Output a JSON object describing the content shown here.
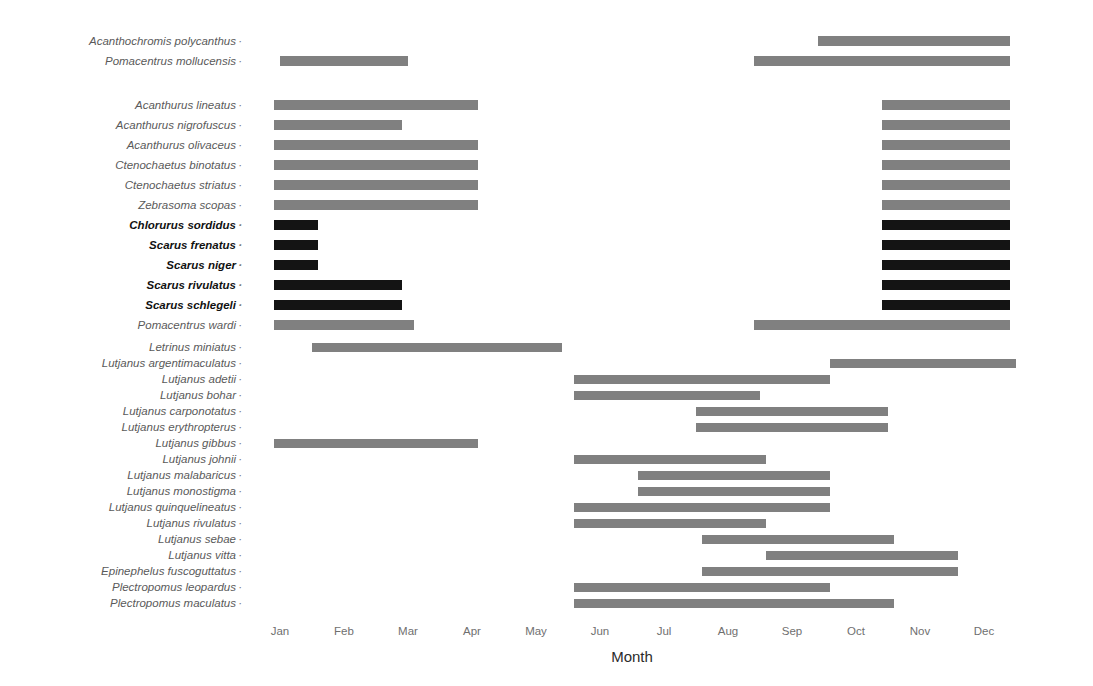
{
  "chart_data": {
    "type": "bar",
    "title": "",
    "xlabel": "Month",
    "ylabel": "",
    "grid": false,
    "legend": "none",
    "xlim": [
      0.5,
      12.5
    ],
    "x_tick_labels": [
      "Jan",
      "Feb",
      "Mar",
      "Apr",
      "May",
      "Jun",
      "Jul",
      "Aug",
      "Sep",
      "Oct",
      "Nov",
      "Dec"
    ],
    "x_tick_values": [
      1,
      2,
      3,
      4,
      5,
      6,
      7,
      8,
      9,
      10,
      11,
      12
    ],
    "colors": {
      "gray_bar": "#808080",
      "black_bar": "#141414",
      "label_gray": "#5a5a5a",
      "label_black": "#111111",
      "background": "#ffffff"
    },
    "groups": [
      {
        "name": "group-1",
        "rows": [
          {
            "label": "Acanthochromis polycanthus",
            "bold": false,
            "color": "#808080",
            "segments": [
              [
                9.4,
                12.4
              ]
            ]
          },
          {
            "label": "Pomacentrus mollucensis",
            "bold": false,
            "color": "#808080",
            "segments": [
              [
                1.0,
                3.0
              ],
              [
                8.4,
                12.4
              ]
            ]
          }
        ]
      },
      {
        "name": "group-2",
        "rows": [
          {
            "label": "Acanthurus lineatus",
            "bold": false,
            "color": "#808080",
            "segments": [
              [
                0.9,
                4.1
              ],
              [
                10.4,
                12.4
              ]
            ]
          },
          {
            "label": "Acanthurus nigrofuscus",
            "bold": false,
            "color": "#808080",
            "segments": [
              [
                0.9,
                2.9
              ],
              [
                10.4,
                12.4
              ]
            ]
          },
          {
            "label": "Acanthurus olivaceus",
            "bold": false,
            "color": "#808080",
            "segments": [
              [
                0.9,
                4.1
              ],
              [
                10.4,
                12.4
              ]
            ]
          },
          {
            "label": "Ctenochaetus binotatus",
            "bold": false,
            "color": "#808080",
            "segments": [
              [
                0.9,
                4.1
              ],
              [
                10.4,
                12.4
              ]
            ]
          },
          {
            "label": "Ctenochaetus striatus",
            "bold": false,
            "color": "#808080",
            "segments": [
              [
                0.9,
                4.1
              ],
              [
                10.4,
                12.4
              ]
            ]
          },
          {
            "label": "Zebrasoma scopas",
            "bold": false,
            "color": "#808080",
            "segments": [
              [
                0.9,
                4.1
              ],
              [
                10.4,
                12.4
              ]
            ]
          },
          {
            "label": "Chlorurus sordidus",
            "bold": true,
            "color": "#141414",
            "segments": [
              [
                0.9,
                1.6
              ],
              [
                10.4,
                12.4
              ]
            ]
          },
          {
            "label": "Scarus frenatus",
            "bold": true,
            "color": "#141414",
            "segments": [
              [
                0.9,
                1.6
              ],
              [
                10.4,
                12.4
              ]
            ]
          },
          {
            "label": "Scarus niger",
            "bold": true,
            "color": "#141414",
            "segments": [
              [
                0.9,
                1.6
              ],
              [
                10.4,
                12.4
              ]
            ]
          },
          {
            "label": "Scarus rivulatus",
            "bold": true,
            "color": "#141414",
            "segments": [
              [
                0.9,
                2.9
              ],
              [
                10.4,
                12.4
              ]
            ]
          },
          {
            "label": "Scarus schlegeli",
            "bold": true,
            "color": "#141414",
            "segments": [
              [
                0.9,
                2.9
              ],
              [
                10.4,
                12.4
              ]
            ]
          },
          {
            "label": "Pomacentrus wardi",
            "bold": false,
            "color": "#808080",
            "segments": [
              [
                0.9,
                3.1
              ],
              [
                8.4,
                12.4
              ]
            ]
          }
        ]
      },
      {
        "name": "group-3",
        "rows": [
          {
            "label": "Letrinus miniatus",
            "bold": false,
            "color": "#808080",
            "segments": [
              [
                1.5,
                5.4
              ]
            ]
          },
          {
            "label": "Lutjanus argentimaculatus",
            "bold": false,
            "color": "#808080",
            "segments": [
              [
                9.6,
                12.5
              ]
            ]
          },
          {
            "label": "Lutjanus adetii",
            "bold": false,
            "color": "#808080",
            "segments": [
              [
                5.6,
                9.6
              ]
            ]
          },
          {
            "label": "Lutjanus bohar",
            "bold": false,
            "color": "#808080",
            "segments": [
              [
                5.6,
                8.5
              ]
            ]
          },
          {
            "label": "Lutjanus carponotatus",
            "bold": false,
            "color": "#808080",
            "segments": [
              [
                7.5,
                10.5
              ]
            ]
          },
          {
            "label": "Lutjanus erythropterus",
            "bold": false,
            "color": "#808080",
            "segments": [
              [
                7.5,
                10.5
              ]
            ]
          },
          {
            "label": "Lutjanus gibbus",
            "bold": false,
            "color": "#808080",
            "segments": [
              [
                0.9,
                4.1
              ]
            ]
          },
          {
            "label": "Lutjanus johnii",
            "bold": false,
            "color": "#808080",
            "segments": [
              [
                5.6,
                8.6
              ]
            ]
          },
          {
            "label": "Lutjanus malabaricus",
            "bold": false,
            "color": "#808080",
            "segments": [
              [
                6.6,
                9.6
              ]
            ]
          },
          {
            "label": "Lutjanus monostigma",
            "bold": false,
            "color": "#808080",
            "segments": [
              [
                6.6,
                9.6
              ]
            ]
          },
          {
            "label": "Lutjanus quinquelineatus",
            "bold": false,
            "color": "#808080",
            "segments": [
              [
                5.6,
                9.6
              ]
            ]
          },
          {
            "label": "Lutjanus rivulatus",
            "bold": false,
            "color": "#808080",
            "segments": [
              [
                5.6,
                8.6
              ]
            ]
          },
          {
            "label": "Lutjanus sebae",
            "bold": false,
            "color": "#808080",
            "segments": [
              [
                7.6,
                10.6
              ]
            ]
          },
          {
            "label": "Lutjanus vitta",
            "bold": false,
            "color": "#808080",
            "segments": [
              [
                8.6,
                11.6
              ]
            ]
          },
          {
            "label": "Epinephelus fuscoguttatus",
            "bold": false,
            "color": "#808080",
            "segments": [
              [
                7.6,
                11.6
              ]
            ]
          },
          {
            "label": "Plectropomus leopardus",
            "bold": false,
            "color": "#808080",
            "segments": [
              [
                5.6,
                9.6
              ]
            ]
          },
          {
            "label": "Plectropomus maculatus",
            "bold": false,
            "color": "#808080",
            "segments": [
              [
                5.6,
                10.6
              ]
            ]
          }
        ]
      }
    ]
  },
  "axis": {
    "title": "Month",
    "tick_dot": "·"
  }
}
